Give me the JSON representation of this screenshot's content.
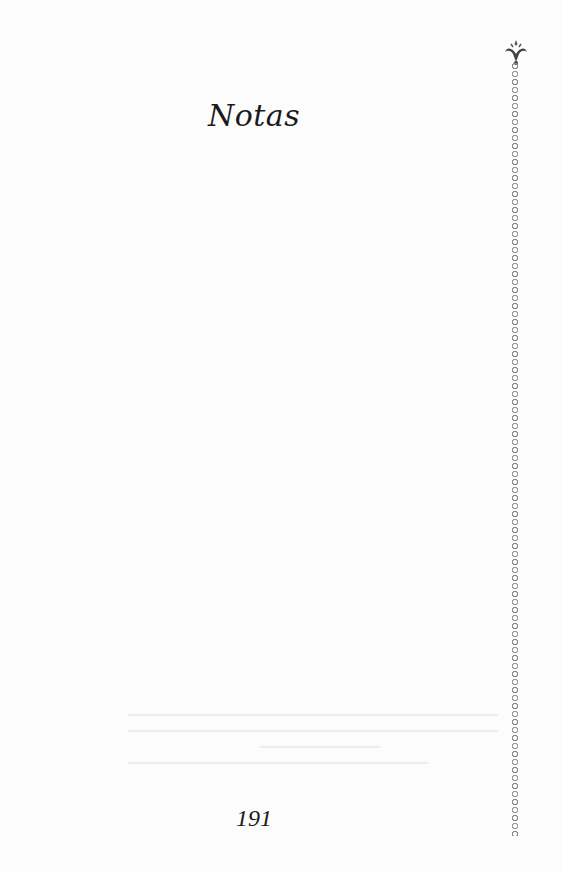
{
  "page": {
    "title": "Notas",
    "page_number": "191",
    "ornament": "fleur-de-lis-chain-border",
    "colors": {
      "text": "#1a1a1a",
      "chain": "#8a8a8a",
      "background": "#fcfcfc"
    }
  }
}
